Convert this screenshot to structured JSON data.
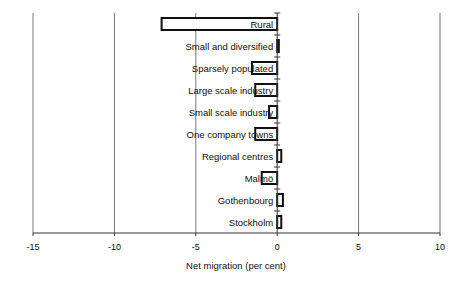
{
  "chart_data": {
    "type": "bar",
    "orientation": "horizontal",
    "title": "",
    "xlabel": "Net migration (per cent)",
    "ylabel": "",
    "xlim": [
      -15,
      10
    ],
    "xticks": [
      -15,
      -10,
      -5,
      0,
      5,
      10
    ],
    "grid": "vertical",
    "legend": "none",
    "categories": [
      "Rural",
      "Small and diversified",
      "Sparsely populated",
      "Large scale industry",
      "Small scale industry",
      "One company towns",
      "Regional centres",
      "Malmö",
      "Gothenbourg",
      "Stockholm"
    ],
    "values": [
      -7.1,
      0.1,
      -1.55,
      -1.35,
      -0.5,
      -1.35,
      0.25,
      -0.95,
      0.35,
      0.25
    ]
  }
}
